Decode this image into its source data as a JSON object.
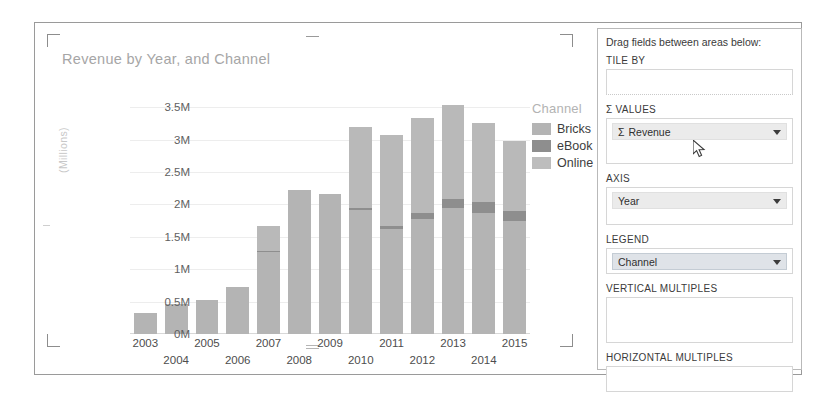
{
  "chart_panel": {
    "title": "Revenue by Year, and Channel",
    "y_axis_title": "(Millions)",
    "legend_title": "Channel"
  },
  "chart_data": {
    "type": "bar",
    "subtype": "stacked-column",
    "title": "Revenue by Year, and Channel",
    "xlabel": "",
    "ylabel": "(Millions)",
    "ylim": [
      0,
      3.75
    ],
    "ytick_labels": [
      "3.5M",
      "3M",
      "2.5M",
      "2M",
      "1.5M",
      "1M",
      "0.5M",
      "0M"
    ],
    "ytick_values": [
      3.5,
      3.0,
      2.5,
      2.0,
      1.5,
      1.0,
      0.5,
      0.0
    ],
    "grid": true,
    "legend_position": "right",
    "categories": [
      "2003",
      "2004",
      "2005",
      "2006",
      "2007",
      "2008",
      "2009",
      "2010",
      "2011",
      "2012",
      "2013",
      "2014",
      "2015"
    ],
    "series": [
      {
        "name": "Bricks",
        "color": "#b4b4b4",
        "values": [
          0.32,
          0.46,
          0.53,
          0.72,
          1.26,
          2.23,
          2.16,
          1.92,
          1.62,
          1.78,
          1.94,
          1.87,
          1.74
        ]
      },
      {
        "name": "eBook",
        "color": "#8e8e8e",
        "values": [
          0.0,
          0.0,
          0.0,
          0.0,
          0.02,
          0.0,
          0.0,
          0.03,
          0.04,
          0.09,
          0.14,
          0.16,
          0.16
        ]
      },
      {
        "name": "Online",
        "color": "#b9b9b9",
        "values": [
          0.0,
          0.0,
          0.0,
          0.0,
          0.38,
          0.0,
          0.0,
          1.25,
          1.41,
          1.46,
          1.46,
          1.22,
          1.08
        ]
      }
    ],
    "totals": [
      0.32,
      0.46,
      0.53,
      0.72,
      1.66,
      2.23,
      2.16,
      3.2,
      3.07,
      3.33,
      3.54,
      3.25,
      2.98
    ]
  },
  "legend": {
    "title": "Channel",
    "items": [
      {
        "label": "Bricks",
        "color": "#b4b4b4"
      },
      {
        "label": "eBook",
        "color": "#8e8e8e"
      },
      {
        "label": "Online",
        "color": "#bdbdbd"
      }
    ]
  },
  "field_panel": {
    "header": "Drag fields between areas below:",
    "sections": [
      {
        "label": "TILE BY",
        "value": "",
        "sigma": false
      },
      {
        "label": "Σ VALUES",
        "value": "Revenue",
        "sigma": true
      },
      {
        "label": "AXIS",
        "value": "Year",
        "sigma": false
      },
      {
        "label": "LEGEND",
        "value": "Channel",
        "sigma": false
      },
      {
        "label": "VERTICAL MULTIPLES",
        "value": "",
        "sigma": false
      },
      {
        "label": "HORIZONTAL MULTIPLES",
        "value": "",
        "sigma": false
      }
    ]
  }
}
